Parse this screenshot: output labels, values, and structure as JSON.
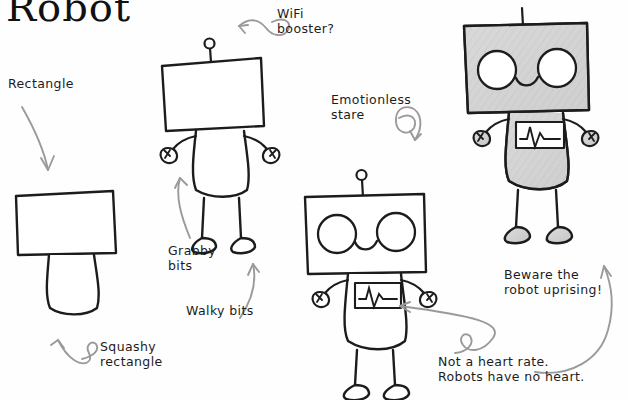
{
  "page": {
    "title": "Robot",
    "background_color": "#fefefe",
    "ink_color": "#1c1c1c",
    "arrow_color": "#9a9a9a",
    "shade_color": "#d2d2d2"
  },
  "annotations": {
    "rectangle": "Rectangle",
    "squashy_rectangle": "Squashy\nrectangle",
    "wifi_booster": "WiFi\nbooster?",
    "grabby_bits": "Grabby\nbits",
    "walky_bits": "Walky bits",
    "emotionless_stare": "Emotionless\nstare",
    "beware_uprising": "Beware the\nrobot uprising!",
    "not_heart_rate": "Not a heart rate.\nRobots have no heart."
  },
  "steps": [
    {
      "id": "step-1",
      "label": "Rectangle head and squashy rectangle body"
    },
    {
      "id": "step-2",
      "label": "Antenna, grabby bits and walky bits"
    },
    {
      "id": "step-3",
      "label": "Eyes, smile and chest monitor"
    },
    {
      "id": "step-4",
      "label": "Shaded finished robot"
    }
  ]
}
